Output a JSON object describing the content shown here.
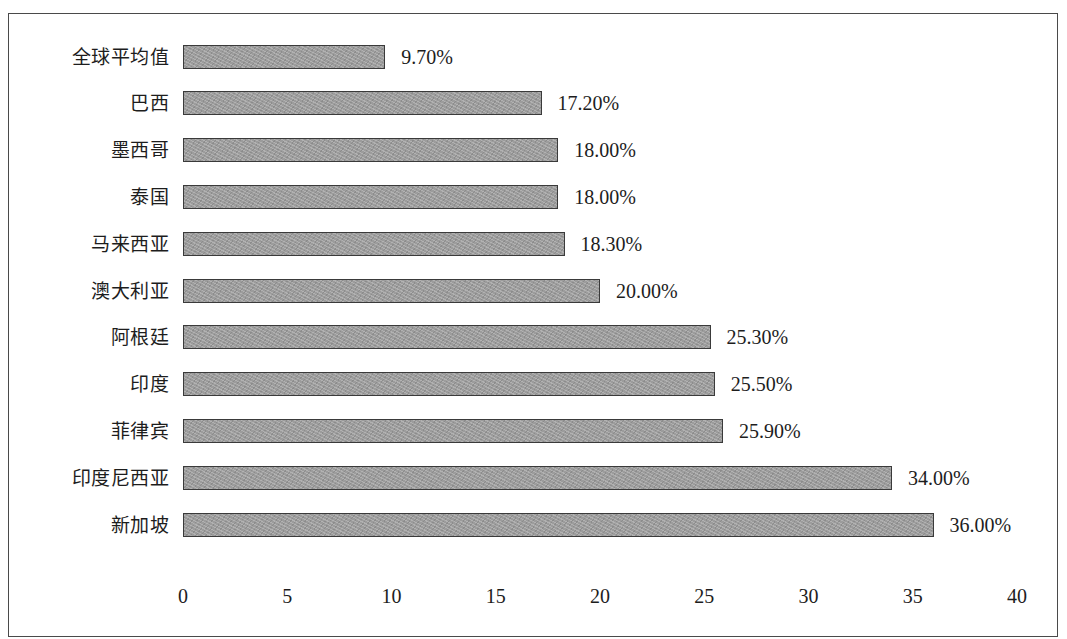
{
  "chart_data": {
    "type": "bar",
    "orientation": "horizontal",
    "title": "",
    "subtitle": "",
    "xlabel": "",
    "ylabel": "",
    "xlim": [
      0,
      40
    ],
    "xticks": [
      "0",
      "5",
      "10",
      "15",
      "20",
      "25",
      "30",
      "35",
      "40"
    ],
    "xtick_values": [
      0,
      5,
      10,
      15,
      20,
      25,
      30,
      35,
      40
    ],
    "grid": false,
    "legend": false,
    "legend_position": "none",
    "bar_color": "#9c9c9c",
    "bar_border_color": "#3a3a3a",
    "frame_color": "#4a4a4a",
    "background_color": "#ffffff",
    "text_color": "#1d1d1d",
    "categories": [
      "全球平均值",
      "巴西",
      "墨西哥",
      "泰国",
      "马来西亚",
      "澳大利亚",
      "阿根廷",
      "印度",
      "菲律宾",
      "印度尼西亚",
      "新加坡"
    ],
    "values": [
      9.7,
      17.2,
      18.0,
      18.0,
      18.3,
      20.0,
      25.3,
      25.5,
      25.9,
      34.0,
      36.0
    ],
    "data_labels": [
      "9.70%",
      "17.20%",
      "18.00%",
      "18.00%",
      "18.30%",
      "20.00%",
      "25.30%",
      "25.50%",
      "25.90%",
      "34.00%",
      "36.00%"
    ]
  }
}
